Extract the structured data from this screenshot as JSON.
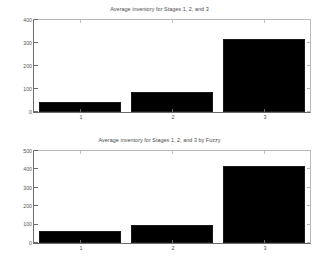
{
  "figures": [
    {
      "id": "top",
      "title": "Average inventory for Stages 1, 2, and 3",
      "xlabels": [
        "1",
        "2",
        "3"
      ],
      "ylabels": [
        "0",
        "100",
        "200",
        "300",
        "400"
      ]
    },
    {
      "id": "bottom",
      "title": "Average inventory for Stages 1, 2, and 3 by Fuzzy",
      "xlabels": [
        "1",
        "2",
        "3"
      ],
      "ylabels": [
        "0",
        "100",
        "200",
        "300",
        "400",
        "500"
      ]
    }
  ],
  "chart_data": [
    {
      "type": "bar",
      "title": "Average inventory for Stages 1, 2, and 3",
      "categories": [
        "1",
        "2",
        "3"
      ],
      "values": [
        42,
        89,
        319
      ],
      "xlabel": "",
      "ylabel": "",
      "ylim": [
        0,
        400
      ],
      "yticks": [
        0,
        100,
        200,
        300,
        400
      ],
      "grid": false,
      "legend": false,
      "bar_color": "#000000"
    },
    {
      "type": "bar",
      "title": "Average inventory for Stages 1, 2, and 3 by Fuzzy",
      "categories": [
        "1",
        "2",
        "3"
      ],
      "values": [
        64,
        97,
        419
      ],
      "xlabel": "",
      "ylabel": "",
      "ylim": [
        0,
        500
      ],
      "yticks": [
        0,
        100,
        200,
        300,
        400,
        500
      ],
      "grid": false,
      "legend": false,
      "bar_color": "#000000"
    }
  ]
}
